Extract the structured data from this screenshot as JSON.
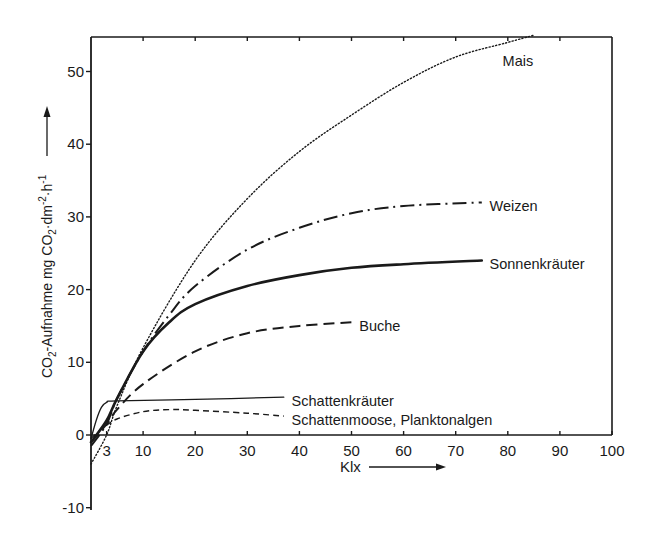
{
  "chart_data": {
    "type": "line",
    "title": "",
    "xlabel": "Klx",
    "ylabel": "CO2-Aufnahme mg CO2·dm-2·h-1",
    "ylabel_parts": {
      "pre": "CO",
      "sub1": "2",
      "mid": "-Aufnahme  mg CO",
      "sub2": "2",
      "mid2": "·dm",
      "sup1": "-2",
      "mid3": "·h",
      "sup2": "-1"
    },
    "xlim": [
      0,
      100
    ],
    "ylim": [
      -10,
      55
    ],
    "x_ticks": [
      3,
      10,
      20,
      30,
      40,
      50,
      60,
      70,
      80,
      90,
      100
    ],
    "x_tick_labels": [
      "3",
      "10",
      "20",
      "30",
      "40",
      "50",
      "60",
      "70",
      "80",
      "90",
      "100"
    ],
    "y_ticks": [
      -10,
      0,
      10,
      20,
      30,
      40,
      50
    ],
    "y_tick_labels": [
      "-10",
      "0",
      "10",
      "20",
      "30",
      "40",
      "50"
    ],
    "grid": false,
    "legend": "inline labels at curve ends",
    "series": [
      {
        "name": "Mais",
        "style": "dotted",
        "x": [
          0,
          3,
          5,
          10,
          20,
          30,
          40,
          50,
          60,
          70,
          80,
          85
        ],
        "values": [
          -4,
          0,
          4,
          12,
          24,
          32.5,
          39,
          44,
          48.5,
          52,
          54,
          55
        ],
        "label_pos": [
          79,
          51.5
        ]
      },
      {
        "name": "Weizen",
        "style": "dashdot",
        "x": [
          0,
          3,
          5,
          10,
          15,
          20,
          30,
          40,
          50,
          60,
          75
        ],
        "values": [
          -1.5,
          1.5,
          5,
          11.5,
          16.5,
          20.5,
          25.5,
          28.5,
          30.5,
          31.5,
          32
        ],
        "label_pos": [
          76.5,
          31.5
        ]
      },
      {
        "name": "Sonnenkräuter",
        "style": "solid-thick",
        "x": [
          0,
          3,
          5,
          10,
          15,
          20,
          30,
          40,
          50,
          60,
          75
        ],
        "values": [
          -1,
          2,
          5,
          11.5,
          15.5,
          18,
          20.5,
          22,
          23,
          23.5,
          24
        ],
        "label_pos": [
          76.5,
          23.5
        ]
      },
      {
        "name": "Buche",
        "style": "dashed",
        "x": [
          0,
          3,
          5,
          10,
          20,
          30,
          40,
          50
        ],
        "values": [
          -1,
          1.5,
          3.5,
          7,
          11.5,
          14,
          15,
          15.5
        ],
        "label_pos": [
          51.5,
          15
        ]
      },
      {
        "name": "Schattenkräuter",
        "style": "solid-thin",
        "x": [
          0,
          1,
          2,
          3,
          5,
          20,
          37
        ],
        "values": [
          -0.5,
          2,
          3.8,
          4.5,
          4.7,
          4.9,
          5.2
        ],
        "label_pos": [
          38.5,
          4.7
        ]
      },
      {
        "name": "Schattenmoose, Planktonalgen",
        "style": "short-dashed",
        "x": [
          0,
          2,
          5,
          10,
          15,
          20,
          30,
          37
        ],
        "values": [
          -0.5,
          0.8,
          2.2,
          3.2,
          3.5,
          3.4,
          3,
          2.6
        ],
        "label_pos": [
          38.5,
          2.1
        ]
      }
    ],
    "annotations": [
      "Klx →",
      "↑ (y-axis arrow)"
    ]
  },
  "colors": {
    "ink": "#1a1a1a",
    "background": "#ffffff"
  },
  "labels": {
    "xlabel": "Klx",
    "zero": "0"
  }
}
